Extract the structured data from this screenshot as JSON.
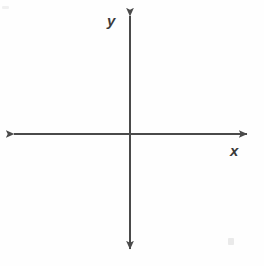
{
  "figure": {
    "name": "cartesian-coordinate-plane",
    "background_color": "#fefefe",
    "width": 264,
    "height": 266
  },
  "chart_data": {
    "type": "scatter",
    "title": "",
    "subtitle": "",
    "xlabel": "x",
    "ylabel": "y",
    "x": [],
    "y": [],
    "series": [],
    "categories": [],
    "values": [],
    "xlim": [
      -1,
      1
    ],
    "ylim": [
      -1,
      1
    ],
    "grid": false,
    "legend": false,
    "legend_position": "none",
    "tick_labels_x": [],
    "tick_labels_y": [],
    "annotations": []
  },
  "axes": {
    "stroke_color": "#4a4a4a",
    "stroke_width": 2,
    "origin": {
      "x": 130,
      "y": 134
    },
    "x_axis": {
      "label": "x",
      "start_x": 12,
      "end_x": 249,
      "y": 134,
      "arrow_start": true,
      "arrow_end": true
    },
    "y_axis": {
      "label": "y",
      "x": 130,
      "start_y": 14,
      "end_y": 251,
      "arrow_start": true,
      "arrow_end": true
    }
  },
  "labels": {
    "y_label": "y",
    "x_label": "x"
  }
}
